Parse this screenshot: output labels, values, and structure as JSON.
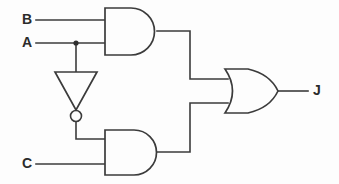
{
  "diagram": {
    "type": "logic-gate-schematic",
    "background_color": "#fdfdfd",
    "line_color": "#3b3b3b",
    "text_color": "#2b2b2b"
  },
  "inputs": [
    {
      "id": "B",
      "label": "B",
      "x": 22,
      "y": 20,
      "wire_y": 20,
      "wire_x_start": 36,
      "wire_x_end": 105
    },
    {
      "id": "A",
      "label": "A",
      "x": 22,
      "y": 43,
      "wire_y": 43,
      "wire_x_start": 36,
      "wire_x_end": 105
    },
    {
      "id": "C",
      "label": "C",
      "x": 22,
      "y": 164,
      "wire_y": 164,
      "wire_x_start": 36,
      "wire_x_end": 105
    }
  ],
  "outputs": [
    {
      "id": "J",
      "label": "J",
      "x": 313,
      "y": 91,
      "wire_x_start": 278,
      "wire_x_end": 308,
      "wire_y": 91
    }
  ],
  "gates": [
    {
      "id": "and1",
      "name": "and-gate-top",
      "type": "AND",
      "symbol_label": "AND",
      "x": 105,
      "y": 8,
      "width": 52,
      "height": 47,
      "inputs": [
        "B",
        "A"
      ],
      "input_ys": [
        20,
        43
      ],
      "output_y": 31
    },
    {
      "id": "not1",
      "name": "inverter-gate",
      "type": "NOT",
      "symbol_label": "NOT",
      "apex_x": 76,
      "top_y": 72,
      "apex_y": 110,
      "left_x": 55,
      "right_x": 97,
      "bubble_cx": 76,
      "bubble_cy": 116,
      "bubble_r": 5.5,
      "inputs": [
        "A"
      ],
      "output_to": "and2"
    },
    {
      "id": "and2",
      "name": "and-gate-bottom",
      "type": "AND",
      "symbol_label": "AND",
      "x": 105,
      "y": 130,
      "width": 52,
      "height": 45,
      "inputs": [
        "NOT A",
        "C"
      ],
      "input_ys": [
        139,
        164
      ],
      "output_y": 152
    },
    {
      "id": "or1",
      "name": "or-gate",
      "type": "OR",
      "symbol_label": "OR",
      "x": 225,
      "y": 69,
      "width": 53,
      "height": 44,
      "inputs": [
        "and1",
        "and2"
      ],
      "input_ys": [
        79,
        103
      ],
      "output_y": 91
    }
  ],
  "junctions": [
    {
      "id": "a-tap",
      "name": "wire-junction-a",
      "x": 76,
      "y": 43,
      "r": 2.6
    }
  ],
  "wires": [
    {
      "id": "w-b-in",
      "name": "wire-b-to-and1",
      "path": "M36,20 L105,20"
    },
    {
      "id": "w-a-in",
      "name": "wire-a-to-and1",
      "path": "M36,43 L105,43"
    },
    {
      "id": "w-a-tap",
      "name": "wire-a-to-inverter",
      "path": "M76,43 L76,72"
    },
    {
      "id": "w-not-out",
      "name": "wire-inverter-to-and2",
      "path": "M76,122 L76,139 L105,139"
    },
    {
      "id": "w-c-in",
      "name": "wire-c-to-and2",
      "path": "M36,164 L105,164"
    },
    {
      "id": "w-and1-or",
      "name": "wire-and1-to-or",
      "path": "M157,31 L190,31 L190,79 L228,79"
    },
    {
      "id": "w-and2-or",
      "name": "wire-and2-to-or",
      "path": "M157,152 L190,152 L190,103 L228,103"
    },
    {
      "id": "w-or-out",
      "name": "wire-or-to-j",
      "path": "M278,91 L308,91"
    }
  ]
}
